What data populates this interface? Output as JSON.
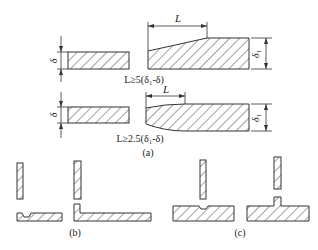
{
  "part_a": {
    "caption": "(a)",
    "row1": {
      "thin_label": "δ",
      "thick_label": "δ₁",
      "length_label": "L",
      "formula": "L≥5(δ₁-δ)"
    },
    "row2": {
      "thin_label": "δ",
      "thick_label": "δ₁",
      "length_label": "L",
      "formula": "L≥2.5(δ₁-δ)"
    }
  },
  "part_b": {
    "caption": "(b)"
  },
  "part_c": {
    "caption": "(c)"
  },
  "colors": {
    "line": "#333333",
    "background": "#ffffff"
  }
}
